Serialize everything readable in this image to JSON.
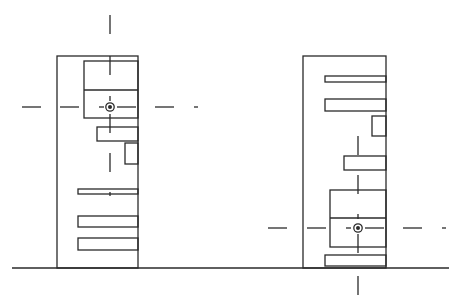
{
  "diagram": {
    "type": "elevation-drawing",
    "colors": {
      "line": "#2a2a2a",
      "background": "#ffffff"
    },
    "ground_line": {
      "x1": 12,
      "x2": 449,
      "y": 268
    },
    "elements": [
      {
        "name": "left-building",
        "outline": {
          "x": 57,
          "y": 56,
          "w": 81,
          "h": 212
        },
        "panel": {
          "x": 84,
          "y": 61,
          "w": 54,
          "h": 57,
          "divider_y": 90
        },
        "bars": [
          {
            "x": 97,
            "y": 127,
            "w": 41,
            "h": 14
          },
          {
            "x": 78,
            "y": 189,
            "w": 60,
            "h": 5
          },
          {
            "x": 78,
            "y": 216,
            "w": 60,
            "h": 11
          },
          {
            "x": 78,
            "y": 238,
            "w": 60,
            "h": 12
          }
        ],
        "small_box": {
          "x": 125,
          "y": 143,
          "w": 13,
          "h": 21
        },
        "target": {
          "cx": 110,
          "cy": 107
        },
        "h_dashes": [
          [
            22,
            41
          ],
          [
            60,
            79
          ],
          [
            99,
            104
          ],
          [
            117,
            136
          ],
          [
            155,
            174
          ],
          [
            194,
            198
          ]
        ],
        "v_dashes": [
          [
            15,
            34
          ],
          [
            56,
            75
          ],
          [
            96,
            101
          ],
          [
            114,
            133
          ],
          [
            153,
            172
          ],
          [
            192,
            196
          ]
        ]
      },
      {
        "name": "right-building",
        "outline": {
          "x": 303,
          "y": 56,
          "w": 83,
          "h": 212
        },
        "panel": {
          "x": 330,
          "y": 190,
          "w": 56,
          "h": 57,
          "divider_y": 218
        },
        "bars": [
          {
            "x": 325,
            "y": 76,
            "w": 61,
            "h": 6
          },
          {
            "x": 325,
            "y": 99,
            "w": 61,
            "h": 12
          },
          {
            "x": 344,
            "y": 156,
            "w": 42,
            "h": 14
          },
          {
            "x": 325,
            "y": 255,
            "w": 61,
            "h": 11
          }
        ],
        "small_box": {
          "x": 372,
          "y": 116,
          "w": 14,
          "h": 20
        },
        "target": {
          "cx": 358,
          "cy": 228
        },
        "h_dashes": [
          [
            268,
            287
          ],
          [
            307,
            326
          ],
          [
            346,
            351
          ],
          [
            365,
            384
          ],
          [
            403,
            422
          ],
          [
            442,
            446
          ]
        ],
        "v_dashes": [
          [
            136,
            155
          ],
          [
            175,
            194
          ],
          [
            214,
            219
          ],
          [
            234,
            253
          ],
          [
            272,
            291
          ],
          [
            276,
            295
          ]
        ]
      }
    ]
  }
}
